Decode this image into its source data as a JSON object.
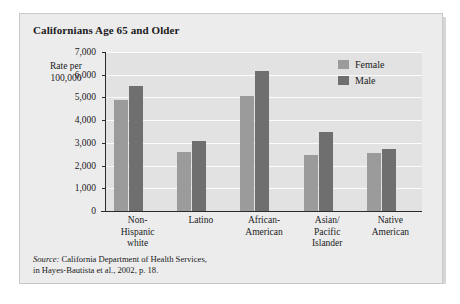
{
  "chart_data": {
    "type": "bar",
    "title": "Californians Age 65 and Older",
    "xlabel": "",
    "ylabel": "Rate per 100,000",
    "ylabel_line1": "Rate per",
    "ylabel_line2": "100,000",
    "ylim": [
      0,
      7000
    ],
    "ytick_labels": [
      "0",
      "1,000",
      "2,000",
      "3,000",
      "4,000",
      "5,000",
      "6,000",
      "7,000"
    ],
    "ytick_values": [
      0,
      1000,
      2000,
      3000,
      4000,
      5000,
      6000,
      7000
    ],
    "grid": true,
    "legend_position": "top-right",
    "categories": [
      "Non-Hispanic white",
      "Latino",
      "African-American",
      "Asian/Pacific Islander",
      "Native American"
    ],
    "category_lines": [
      [
        "Non-",
        "Hispanic",
        "white"
      ],
      [
        "Latino"
      ],
      [
        "African-",
        "American"
      ],
      [
        "Asian/",
        "Pacific",
        "Islander"
      ],
      [
        "Native",
        "American"
      ]
    ],
    "series": [
      {
        "name": "Female",
        "color": "#9b9b9b",
        "values": [
          4900,
          2600,
          5050,
          2450,
          2550
        ]
      },
      {
        "name": "Male",
        "color": "#6f6f6f",
        "values": [
          5500,
          3100,
          6150,
          3500,
          2750
        ]
      }
    ]
  },
  "source": {
    "prefix": "Source:",
    "line1": " California Department of Health Services,",
    "line2": "in Hayes-Bautista et al., 2002, p. 18."
  }
}
